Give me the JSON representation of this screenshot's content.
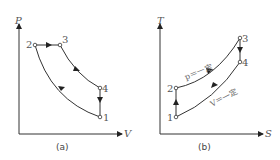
{
  "figure_a": {
    "caption": "(a)",
    "y_axis": "P",
    "x_axis": "V",
    "points": [
      "1",
      "2",
      "3",
      "4"
    ]
  },
  "figure_b": {
    "caption": "(b)",
    "y_axis": "T",
    "x_axis": "S",
    "points": [
      "1",
      "2",
      "3",
      "4"
    ],
    "annotation_p": "p＝一定",
    "annotation_v": "V＝一定"
  }
}
